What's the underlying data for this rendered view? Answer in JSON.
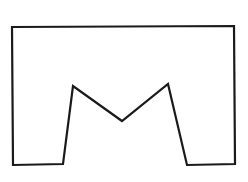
{
  "diagram": {
    "type": "polygon-outline",
    "stroke_color": "#1a1a1a",
    "fill_color": "#ffffff",
    "stroke_width": 2.2,
    "points": [
      [
        12,
        27
      ],
      [
        234,
        26
      ],
      [
        235,
        164
      ],
      [
        187,
        165
      ],
      [
        168,
        84
      ],
      [
        122,
        121
      ],
      [
        73,
        86
      ],
      [
        63,
        164
      ],
      [
        13,
        165
      ]
    ]
  }
}
